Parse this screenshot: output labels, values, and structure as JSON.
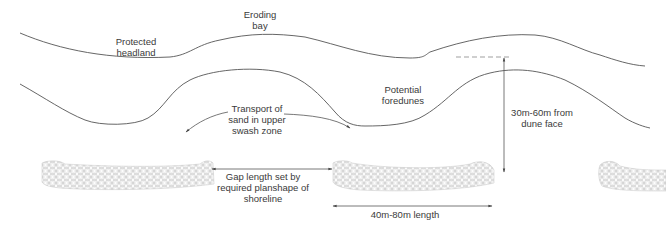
{
  "diagram": {
    "labels": {
      "protected_headland": [
        "Protected",
        "headland"
      ],
      "eroding_bay": [
        "Eroding",
        "bay"
      ],
      "potential_foredunes": [
        "Potential",
        "foredunes"
      ],
      "transport": [
        "Transport of",
        "sand in upper",
        "swash zone"
      ],
      "gap_length": [
        "Gap length set by",
        "required planshape of",
        "shoreline"
      ],
      "offset": [
        "30m-60m from",
        "dune face"
      ],
      "breakwater_length": [
        "40m-80m length"
      ]
    },
    "elements": [
      {
        "id": "dune-line",
        "type": "curve",
        "description": "Landward dune/shore line"
      },
      {
        "id": "shoreline",
        "type": "curve",
        "description": "Shoreline with salients behind breakwaters"
      },
      {
        "id": "breakwater-1",
        "type": "rock-structure"
      },
      {
        "id": "breakwater-2",
        "type": "rock-structure"
      },
      {
        "id": "breakwater-3",
        "type": "rock-structure",
        "partial": true
      },
      {
        "id": "transport-arrow",
        "type": "double-curved-arrow"
      },
      {
        "id": "gap-dimension",
        "type": "dimension-arrow"
      },
      {
        "id": "offset-dimension",
        "type": "dimension-arrow"
      },
      {
        "id": "length-dimension",
        "type": "dimension-arrow"
      }
    ],
    "colors": {
      "line": "#555555",
      "rock": "#b5b5b5",
      "text": "#3a3a3a"
    }
  }
}
